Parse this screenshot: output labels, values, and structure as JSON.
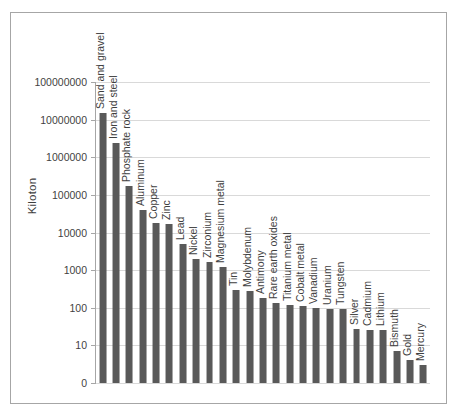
{
  "chart_data": {
    "type": "bar",
    "title": "",
    "subtitle": "",
    "xlabel": "",
    "ylabel": "Kiloton",
    "scale": "log",
    "grid": true,
    "legend": false,
    "bar_color": "#595959",
    "gridline_color": "#d9d9d9",
    "axis_color": "#a6a6a6",
    "ytick_labels": [
      "100000000",
      "10000000",
      "1000000",
      "100000",
      "10000",
      "1000",
      "100",
      "10",
      "0"
    ],
    "ytick_values": [
      100000000,
      10000000,
      1000000,
      100000,
      10000,
      1000,
      100,
      10,
      0
    ],
    "ylim": [
      1,
      100000000
    ],
    "categories": [
      "Sand and gravel",
      "Iron and steel",
      "Phosphate rock",
      "Aluminum",
      "Copper",
      "Zinc",
      "Lead",
      "Nickel",
      "Zirconium",
      "Magnesium metal",
      "Tin",
      "Molybdenum",
      "Antimony",
      "Rare earth oxides",
      "Titanium metal",
      "Cobalt metal",
      "Vanadium",
      "Uranium",
      "Tungsten",
      "Silver",
      "Cadmium",
      "Lithium",
      "Bismuth",
      "Gold",
      "Mercury"
    ],
    "values": [
      15000000,
      2400000,
      170000,
      39000,
      18000,
      17000,
      5000,
      2000,
      1600,
      1200,
      300,
      280,
      180,
      130,
      120,
      110,
      100,
      95,
      90,
      27,
      25,
      25,
      7,
      4,
      3
    ]
  }
}
